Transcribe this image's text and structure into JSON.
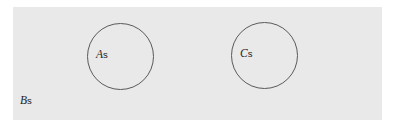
{
  "diagram": {
    "type": "set-diagram",
    "background_color": "#ffffff",
    "panel_color": "#e9e9e9",
    "stroke_color": "#5a5a5a",
    "text_color": "#1d1d1d",
    "universe": {
      "name": "universe-set",
      "symbol": "B",
      "subscript": "s",
      "label": "Bs"
    },
    "sets": [
      {
        "name": "set-a",
        "symbol": "A",
        "subscript": "s",
        "label": "As",
        "shape": "circle"
      },
      {
        "name": "set-c",
        "symbol": "C",
        "subscript": "s",
        "label": "Cs",
        "shape": "circle"
      }
    ]
  }
}
